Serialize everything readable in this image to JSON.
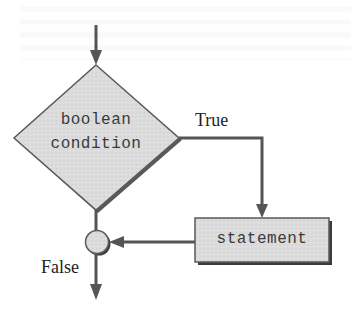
{
  "diagram": {
    "type": "flowchart",
    "title": "",
    "nodes": [
      {
        "id": "condition",
        "shape": "diamond",
        "label_lines": [
          "boolean",
          "condition"
        ]
      },
      {
        "id": "statement",
        "shape": "rectangle",
        "label": "statement"
      },
      {
        "id": "junction",
        "shape": "circle",
        "label": ""
      }
    ],
    "edges": [
      {
        "from": "entry",
        "to": "condition",
        "label": ""
      },
      {
        "from": "condition",
        "to": "statement",
        "label": "True"
      },
      {
        "from": "statement",
        "to": "junction",
        "label": ""
      },
      {
        "from": "condition",
        "to": "junction",
        "label": ""
      },
      {
        "from": "junction",
        "to": "exit",
        "label": "False"
      }
    ],
    "labels": {
      "condition_line1": "boolean",
      "condition_line2": "condition",
      "statement": "statement",
      "true_branch": "True",
      "false_branch": "False"
    },
    "colors": {
      "line": "#555555",
      "shape_fill": "#d9d9d9",
      "shape_border": "#5a5a5a",
      "shadow": "#3c3c3c",
      "text": "#3a3a3a"
    }
  }
}
